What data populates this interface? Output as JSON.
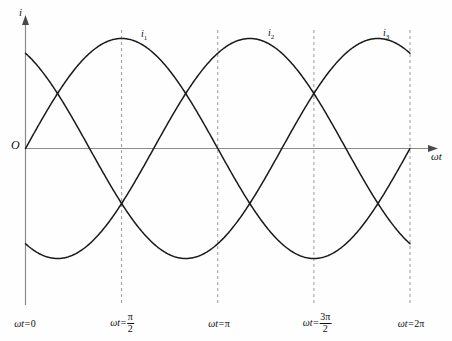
{
  "figure": {
    "title": "",
    "axis": {
      "y_label": "i",
      "x_label": "ωt",
      "origin_label": "O"
    },
    "curve_labels": [
      {
        "name": "i",
        "sub": "1"
      },
      {
        "name": "i",
        "sub": "2"
      },
      {
        "name": "i",
        "sub": "3"
      }
    ],
    "x_ticks": [
      {
        "text": "ωt=0",
        "type": "plain",
        "omega": "ωt=",
        "value": "0"
      },
      {
        "text": "ωt=π/2",
        "type": "fraction",
        "omega": "ωt=",
        "num": "π",
        "den": "2"
      },
      {
        "text": "ωt=π",
        "type": "plain",
        "omega": "ωt=",
        "value": "π"
      },
      {
        "text": "ωt=3π/2",
        "type": "fraction",
        "omega": "ωt=",
        "num": "3π",
        "den": "2"
      },
      {
        "text": "ωt=2π",
        "type": "plain",
        "omega": "ωt=",
        "value": "2π"
      }
    ],
    "colors": {
      "curve": "#1a1a1a",
      "axis": "#808080",
      "dashed": "#707070",
      "text": "#111111",
      "background": "#fefefe"
    }
  },
  "chart_data": {
    "type": "line",
    "title": "",
    "xlabel": "ωt",
    "ylabel": "i",
    "grid": false,
    "legend_position": "inline-above-curves",
    "xlim": [
      0,
      6.283185
    ],
    "ylim": [
      -1.15,
      1.15
    ],
    "x_tick_values": [
      0,
      1.570796,
      3.141593,
      4.712389,
      6.283185
    ],
    "x_tick_labels": [
      "ωt=0",
      "ωt=π/2",
      "ωt=π",
      "ωt=3π/2",
      "ωt=2π"
    ],
    "amplitude": 1.0,
    "series": [
      {
        "name": "i1",
        "phase_deg": 0,
        "formula": "sin(ωt)",
        "label_at": {
          "x": 2.0,
          "y": 0.96
        },
        "x": [
          0,
          0.3927,
          0.7854,
          1.1781,
          1.5708,
          1.9635,
          2.3562,
          2.7489,
          3.1416,
          3.5343,
          3.927,
          4.3197,
          4.7124,
          5.1051,
          5.4978,
          5.8905,
          6.2832
        ],
        "y": [
          0.0,
          0.383,
          0.707,
          0.924,
          1.0,
          0.924,
          0.707,
          0.383,
          0.0,
          -0.383,
          -0.707,
          -0.924,
          -1.0,
          -0.924,
          -0.707,
          -0.383,
          0.0
        ]
      },
      {
        "name": "i2",
        "phase_deg": -120,
        "formula": "sin(ωt - 2π/3)",
        "label_at": {
          "x": 4.04,
          "y": 0.98
        },
        "x": [
          0,
          0.3927,
          0.7854,
          1.1781,
          1.5708,
          1.9635,
          2.3562,
          2.7489,
          3.1416,
          3.5343,
          3.927,
          4.3197,
          4.7124,
          5.1051,
          5.4978,
          5.8905,
          6.2832
        ],
        "y": [
          -0.866,
          -0.991,
          -0.966,
          -0.793,
          -0.5,
          -0.131,
          0.259,
          0.609,
          0.866,
          0.991,
          0.966,
          0.793,
          0.5,
          0.131,
          -0.259,
          -0.609,
          -0.866
        ]
      },
      {
        "name": "i3",
        "phase_deg": 120,
        "formula": "sin(ωt + 2π/3)",
        "label_at": {
          "x": 5.93,
          "y": 0.98
        },
        "x": [
          0,
          0.3927,
          0.7854,
          1.1781,
          1.5708,
          1.9635,
          2.3562,
          2.7489,
          3.1416,
          3.5343,
          3.927,
          4.3197,
          4.7124,
          5.1051,
          5.4978,
          5.8905,
          6.2832
        ],
        "y": [
          0.866,
          0.609,
          0.259,
          -0.131,
          -0.5,
          -0.793,
          -0.966,
          -0.991,
          -0.866,
          -0.609,
          -0.259,
          0.131,
          0.5,
          0.793,
          0.966,
          0.991,
          0.866
        ]
      }
    ],
    "vertical_dashed_lines_at": [
      1.570796,
      3.141593,
      4.712389,
      6.283185
    ]
  }
}
